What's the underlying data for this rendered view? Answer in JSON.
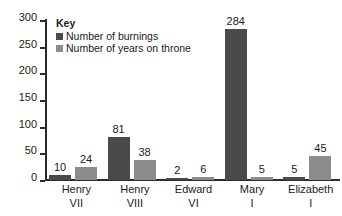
{
  "chart_data": {
    "type": "bar",
    "title": "",
    "xlabel": "",
    "ylabel": "",
    "ylim": [
      0,
      300
    ],
    "ytick_values": [
      0,
      50,
      100,
      150,
      200,
      250,
      300
    ],
    "ytick_labels": [
      "0",
      "50",
      "100",
      "150",
      "200",
      "250",
      "300"
    ],
    "grid": false,
    "legend_position": "top-left",
    "legend_title": "Key",
    "categories": [
      {
        "line1": "Henry",
        "line2": "VII"
      },
      {
        "line1": "Henry",
        "line2": "VIII"
      },
      {
        "line1": "Edward",
        "line2": "VI"
      },
      {
        "line1": "Mary",
        "line2": "I"
      },
      {
        "line1": "Elizabeth",
        "line2": "I"
      }
    ],
    "category_labels": [
      "Henry VII",
      "Henry VIII",
      "Edward VI",
      "Mary I",
      "Elizabeth I"
    ],
    "series": [
      {
        "name": "Number of burnings",
        "color": "#4a4a4a",
        "values": [
          10,
          81,
          2,
          284,
          5
        ],
        "value_labels": [
          "10",
          "81",
          "2",
          "284",
          "5"
        ]
      },
      {
        "name": "Number of years on throne",
        "color": "#8c8c8c",
        "values": [
          24,
          38,
          6,
          5,
          45
        ],
        "value_labels": [
          "24",
          "38",
          "6",
          "5",
          "45"
        ]
      }
    ]
  },
  "colors": {
    "background": "#ffffff",
    "axis": "#2b2b2b",
    "text": "#1a1a1a",
    "series_burnings": "#4a4a4a",
    "series_years": "#8c8c8c"
  }
}
